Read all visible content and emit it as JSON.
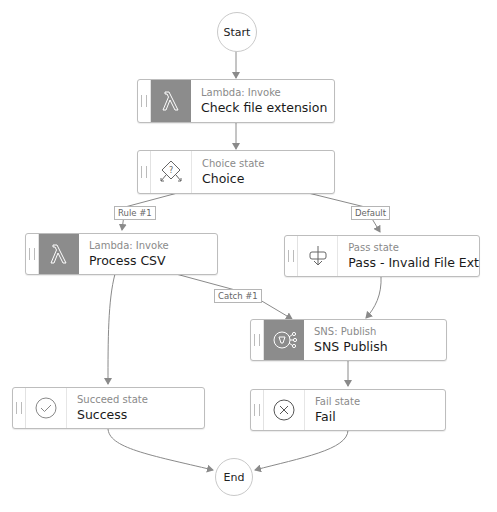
{
  "diagram": {
    "start": {
      "label": "Start"
    },
    "end": {
      "label": "End"
    },
    "states": [
      {
        "id": "check",
        "type": "Lambda: Invoke",
        "name": "Check file extension",
        "icon": "lambda-icon"
      },
      {
        "id": "choice",
        "type": "Choice state",
        "name": "Choice",
        "icon": "choice-icon"
      },
      {
        "id": "process",
        "type": "Lambda: Invoke",
        "name": "Process CSV",
        "icon": "lambda-icon"
      },
      {
        "id": "pass",
        "type": "Pass state",
        "name": "Pass - Invalid File Ext",
        "icon": "pass-icon"
      },
      {
        "id": "sns",
        "type": "SNS: Publish",
        "name": "SNS Publish",
        "icon": "sns-icon"
      },
      {
        "id": "success",
        "type": "Succeed state",
        "name": "Success",
        "icon": "check-circle-icon"
      },
      {
        "id": "fail",
        "type": "Fail state",
        "name": "Fail",
        "icon": "x-circle-icon"
      }
    ],
    "edge_labels": {
      "rule1": "Rule #1",
      "default": "Default",
      "catch1": "Catch #1"
    },
    "colors": {
      "edge": "#8a8a8a",
      "border": "#bdbdbd",
      "task_icon_bg": "#8c8c8c"
    }
  }
}
